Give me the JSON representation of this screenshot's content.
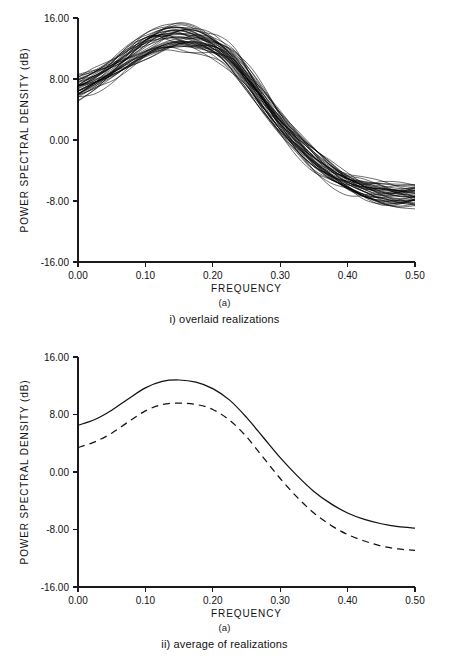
{
  "figure": {
    "panels": [
      {
        "id": "overlaid",
        "caption_label": "(a)",
        "caption_text": "i)  overlaid realizations"
      },
      {
        "id": "average",
        "caption_label": "(a)",
        "caption_text": "ii) average of realizations"
      }
    ]
  },
  "chart_data": [
    {
      "type": "line",
      "id": "overlaid-realizations",
      "title": "",
      "xlabel": "FREQUENCY",
      "ylabel": "POWER SPECTRAL DENSITY (dB)",
      "xlim": [
        0.0,
        0.5
      ],
      "ylim": [
        -16.0,
        16.0
      ],
      "xticks": [
        0.0,
        0.1,
        0.2,
        0.3,
        0.4,
        0.5
      ],
      "xticklabels": [
        "0.00",
        "0.10",
        "0.20",
        "0.30",
        "0.40",
        "0.50"
      ],
      "yticks": [
        -16.0,
        -8.0,
        0.0,
        8.0,
        16.0
      ],
      "yticklabels": [
        "-16.00",
        "-8.00",
        "0.00",
        "8.00",
        "16.00"
      ],
      "grid": false,
      "legend": "none",
      "n_realizations": 40,
      "x": [
        0.0,
        0.025,
        0.05,
        0.075,
        0.1,
        0.125,
        0.15,
        0.175,
        0.2,
        0.225,
        0.25,
        0.275,
        0.3,
        0.325,
        0.35,
        0.375,
        0.4,
        0.425,
        0.45,
        0.475,
        0.5
      ],
      "envelope_mean": [
        6.8,
        7.8,
        9.1,
        10.7,
        12.2,
        13.2,
        13.5,
        13.2,
        12.4,
        10.8,
        8.2,
        5.2,
        2.2,
        -0.4,
        -2.6,
        -4.3,
        -5.6,
        -6.5,
        -7.0,
        -7.3,
        -7.4
      ],
      "envelope_upper": [
        8.6,
        9.5,
        10.8,
        12.4,
        13.9,
        15.0,
        15.4,
        15.0,
        14.1,
        12.6,
        10.1,
        7.0,
        4.0,
        1.4,
        -0.8,
        -2.6,
        -4.0,
        -4.9,
        -5.4,
        -5.6,
        -5.7
      ],
      "envelope_lower": [
        5.0,
        6.0,
        7.3,
        8.9,
        10.3,
        11.2,
        11.4,
        11.2,
        10.5,
        9.0,
        6.4,
        3.3,
        0.3,
        -2.3,
        -4.5,
        -6.2,
        -7.5,
        -8.4,
        -8.9,
        -9.2,
        -9.3
      ],
      "peak_frequency": 0.15,
      "peak_value": 13.5
    },
    {
      "type": "line",
      "id": "average-of-realizations",
      "title": "",
      "xlabel": "FREQUENCY",
      "ylabel": "POWER SPECTRAL DENSITY (dB)",
      "xlim": [
        0.0,
        0.5
      ],
      "ylim": [
        -16.0,
        16.0
      ],
      "xticks": [
        0.0,
        0.1,
        0.2,
        0.3,
        0.4,
        0.5
      ],
      "xticklabels": [
        "0.00",
        "0.10",
        "0.20",
        "0.30",
        "0.40",
        "0.50"
      ],
      "yticks": [
        -16.0,
        -8.0,
        0.0,
        8.0,
        16.0
      ],
      "yticklabels": [
        "-16.00",
        "-8.00",
        "0.00",
        "8.00",
        "16.00"
      ],
      "grid": false,
      "legend": "none",
      "x": [
        0.0,
        0.025,
        0.05,
        0.075,
        0.1,
        0.125,
        0.15,
        0.175,
        0.2,
        0.225,
        0.25,
        0.275,
        0.3,
        0.325,
        0.35,
        0.375,
        0.4,
        0.425,
        0.45,
        0.475,
        0.5
      ],
      "series": [
        {
          "name": "true spectrum",
          "style": "solid",
          "values": [
            6.5,
            7.3,
            8.6,
            10.2,
            11.7,
            12.6,
            12.8,
            12.5,
            11.6,
            10.0,
            7.6,
            4.8,
            2.0,
            -0.5,
            -2.7,
            -4.4,
            -5.7,
            -6.6,
            -7.2,
            -7.6,
            -7.8
          ]
        },
        {
          "name": "average of realizations",
          "style": "dashed",
          "values": [
            3.4,
            4.2,
            5.4,
            7.0,
            8.5,
            9.4,
            9.6,
            9.4,
            8.7,
            7.2,
            4.9,
            2.0,
            -0.9,
            -3.5,
            -5.7,
            -7.4,
            -8.7,
            -9.6,
            -10.3,
            -10.7,
            -10.9
          ]
        }
      ],
      "peak_frequency": 0.15,
      "peak_value_solid": 12.8,
      "peak_value_dashed": 9.6
    }
  ],
  "colors": {
    "ink": "#111111",
    "background": "#ffffff"
  }
}
